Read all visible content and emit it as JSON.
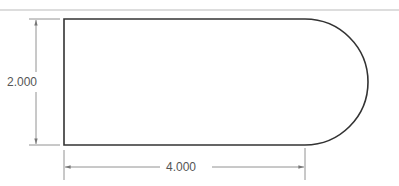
{
  "drawing": {
    "shape": "obround-slot",
    "description": "Rectangle with one semicircular end",
    "colors": {
      "outline": "#333333",
      "dimension": "#666666",
      "border": "#bbbbbb",
      "background": "#ffffff"
    }
  },
  "dimensions": {
    "height": {
      "label": "2.000",
      "orientation": "vertical"
    },
    "length": {
      "label": "4.000",
      "orientation": "horizontal"
    }
  }
}
